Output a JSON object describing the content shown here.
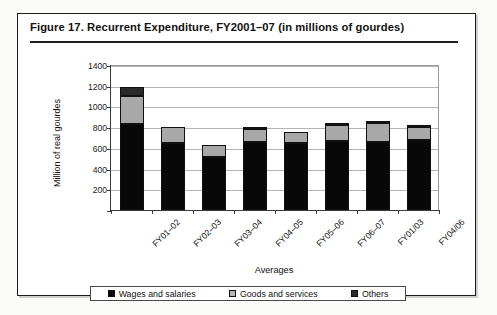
{
  "figure": {
    "title": "Figure 17.  Recurrent Expenditure, FY2001–07 (in millions of gourdes)"
  },
  "chart_data": {
    "type": "bar",
    "subtype": "stacked-column",
    "title": "Figure 17.  Recurrent Expenditure, FY2001–07 (in millions of gourdes)",
    "xlabel": "Averages",
    "ylabel": "Million of real gourdes",
    "ylim": [
      0,
      1400
    ],
    "ytick_step": 200,
    "yticks": [
      0,
      200,
      400,
      600,
      800,
      1000,
      1200,
      1400
    ],
    "grid": true,
    "legend_position": "bottom",
    "categories": [
      "FY01–02",
      "FY02–03",
      "FY03–04",
      "FY04–05",
      "FY05–06",
      "FY06–07",
      "FY01/03",
      "FY04/06"
    ],
    "series": [
      {
        "name": "Wages and salaries",
        "color": "#080808",
        "values": [
          830,
          650,
          510,
          655,
          650,
          670,
          655,
          680
        ]
      },
      {
        "name": "Goods and services",
        "color": "#a8a8a8",
        "values": [
          275,
          155,
          115,
          130,
          105,
          150,
          185,
          120
        ]
      },
      {
        "name": "Others",
        "color": "#2a2a2a",
        "values": [
          85,
          0,
          0,
          20,
          0,
          15,
          20,
          10
        ]
      }
    ],
    "totals": [
      1190,
      805,
      625,
      805,
      755,
      835,
      860,
      810
    ]
  },
  "legend": {
    "items": [
      {
        "label": "Wages and salaries",
        "swatch": "wages"
      },
      {
        "label": "Goods and services",
        "swatch": "goods"
      },
      {
        "label": "Others",
        "swatch": "others"
      }
    ]
  }
}
